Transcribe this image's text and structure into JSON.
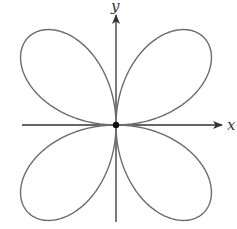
{
  "figure": {
    "type": "polar-rose",
    "petals": 4,
    "equation_form": "r = a·sin(2θ)",
    "origin_marker": "filled dot at origin",
    "axes": {
      "x_label": "x",
      "y_label": "y"
    },
    "colors": {
      "curve": "#6b6b6b",
      "axes": "#333333",
      "origin_dot": "#111111",
      "background": "#ffffff"
    }
  }
}
